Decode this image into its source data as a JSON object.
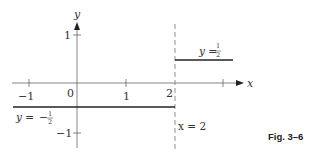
{
  "figure": {
    "caption": "Fig. 3–6",
    "axes": {
      "x_label": "x",
      "y_label": "y",
      "x_ticks": [
        {
          "value": -1,
          "label": "−1"
        },
        {
          "value": 0,
          "label": "0"
        },
        {
          "value": 1,
          "label": "1"
        },
        {
          "value": 2,
          "label": "2"
        },
        {
          "value": 3,
          "label": ""
        }
      ],
      "y_ticks": [
        {
          "value": 1,
          "label": "1"
        },
        {
          "value": -1,
          "label": "−1"
        }
      ]
    },
    "segments": [
      {
        "name": "lower",
        "y": -0.5,
        "x_from": -1.3,
        "x_to": 2,
        "label_lhs": "y =",
        "label_sign": "−",
        "label_num": "1",
        "label_den": "2"
      },
      {
        "name": "upper",
        "y": 0.5,
        "x_from": 2,
        "x_to": 3.2,
        "label_lhs": "y =",
        "label_num": "1",
        "label_den": "2"
      }
    ],
    "discontinuity": {
      "x": 2,
      "label": "x = 2",
      "style": "dashed"
    },
    "colors": {
      "line": "#222222",
      "axis": "#555555",
      "dash": "#777777"
    }
  }
}
